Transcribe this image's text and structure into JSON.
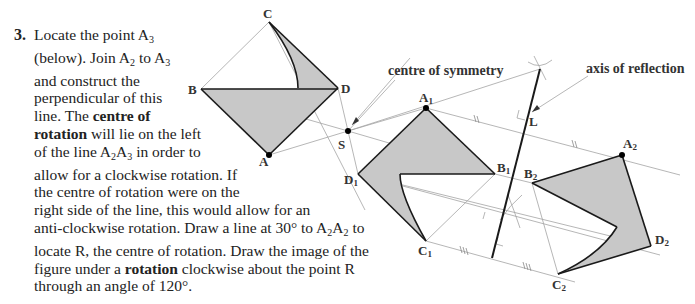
{
  "step": {
    "number": "3.",
    "lines": [
      {
        "parts": [
          {
            "t": "Locate the point A"
          },
          {
            "sub": "3"
          }
        ]
      },
      {
        "parts": [
          {
            "t": "(below). Join A"
          },
          {
            "sub": "2"
          },
          {
            "t": " to A"
          },
          {
            "sub": "3"
          }
        ]
      },
      {
        "parts": [
          {
            "t": "and construct the"
          }
        ]
      },
      {
        "parts": [
          {
            "t": "perpendicular of this"
          }
        ]
      },
      {
        "parts": [
          {
            "t": "line. The "
          },
          {
            "b": "centre of"
          }
        ]
      },
      {
        "parts": [
          {
            "b": "rotation"
          },
          {
            "t": " will lie on the left"
          }
        ]
      },
      {
        "parts": [
          {
            "t": "of the line A"
          },
          {
            "sub": "2"
          },
          {
            "t": "A"
          },
          {
            "sub": "3"
          },
          {
            "t": " in order to"
          }
        ]
      },
      {
        "parts": [
          {
            "t": "allow for a clockwise rotation. If"
          }
        ]
      },
      {
        "parts": [
          {
            "t": "the centre of rotation were on the"
          }
        ]
      },
      {
        "parts": [
          {
            "t": "right side of the line, this would allow for an"
          }
        ]
      },
      {
        "parts": [
          {
            "t": "anti-clockwise rotation. Draw a line at 30° to A"
          },
          {
            "sub": "2"
          },
          {
            "t": "A"
          },
          {
            "sub": "2"
          },
          {
            "t": " to"
          }
        ]
      },
      {
        "parts": [
          {
            "t": "locate R, the centre of rotation. Draw the image of the"
          }
        ]
      },
      {
        "parts": [
          {
            "t": "figure under a "
          },
          {
            "b": "rotation"
          },
          {
            "t": " clockwise about the point R"
          }
        ]
      },
      {
        "parts": [
          {
            "t": "through an angle of 120°."
          }
        ]
      }
    ]
  },
  "diagram": {
    "annotations": {
      "centre_of_symmetry": "centre of symmetry",
      "axis_of_reflection": "axis of reflection"
    },
    "labels": {
      "A": "A",
      "B": "B",
      "C": "C",
      "D": "D",
      "S": "S",
      "L": "L",
      "A1": "A",
      "B1": "B",
      "C1": "C",
      "D1": "D",
      "sub1": "1",
      "A2": "A",
      "B2": "B",
      "C2": "C",
      "D2": "D",
      "sub2": "2"
    },
    "colors": {
      "fill": "#c8c8c8",
      "outline": "#1a1a1a",
      "construction": "#9a9a9a"
    }
  }
}
